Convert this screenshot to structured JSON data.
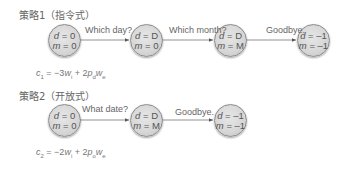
{
  "strategy1": {
    "title": "策略1（指令式）",
    "nodes": [
      {
        "d": "0",
        "m": "0"
      },
      {
        "d": "D",
        "m": "0"
      },
      {
        "d": "D",
        "m": "M"
      },
      {
        "d": "–1",
        "m": "–1"
      }
    ],
    "edges": [
      {
        "label": "Which day?"
      },
      {
        "label": "Which month?"
      },
      {
        "label": "Goodbye."
      }
    ],
    "formula": {
      "lhs": "c",
      "lhs_sub": "1",
      "eq": " = −3",
      "w1": "w",
      "w1_sub": "i",
      "plus": " + 2",
      "p": "p",
      "p_sub": "d",
      "w2": "w",
      "w2_sub": "e"
    }
  },
  "strategy2": {
    "title": "策略2（开放式）",
    "nodes": [
      {
        "d": "0",
        "m": "0"
      },
      {
        "d": "D",
        "m": "M"
      },
      {
        "d": "–1",
        "m": "–1"
      }
    ],
    "edges": [
      {
        "label": "What date?"
      },
      {
        "label": "Goodbye."
      }
    ],
    "formula": {
      "lhs": "c",
      "lhs_sub": "2",
      "eq": " = −2",
      "w1": "w",
      "w1_sub": "i",
      "plus": " + 2",
      "p": "p",
      "p_sub": "o",
      "w2": "w",
      "w2_sub": "e"
    }
  },
  "labels": {
    "d_var": "d",
    "m_var": "m",
    "eq": " = "
  }
}
